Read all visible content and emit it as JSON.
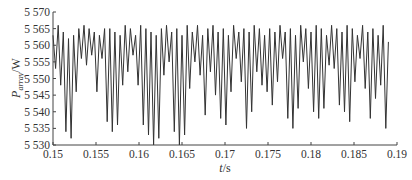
{
  "chart_data": {
    "type": "line",
    "title": "",
    "xlabel": "t/s",
    "xlabel_var": "t",
    "xlabel_unit": "/s",
    "ylabel": "P_array/W",
    "ylabel_var": "P",
    "ylabel_sub": "array",
    "ylabel_unit": "/W",
    "xlim": [
      0.15,
      0.19
    ],
    "ylim": [
      5530,
      5570
    ],
    "xticks": [
      0.15,
      0.155,
      0.16,
      0.165,
      0.17,
      0.175,
      0.18,
      0.185,
      0.19
    ],
    "xtick_labels": [
      "0.15",
      "0.155",
      "0.16",
      "0.165",
      "0.17",
      "0.175",
      "0.18",
      "0.185",
      "0.19"
    ],
    "yticks": [
      5530,
      5535,
      5540,
      5545,
      5550,
      5555,
      5560,
      5565,
      5570
    ],
    "ytick_labels": [
      "5 530",
      "5 535",
      "5 540",
      "5 545",
      "5 550",
      "5 555",
      "5 560",
      "5 565",
      "5 570"
    ],
    "grid": false,
    "legend": null,
    "line_color": "#333333",
    "series": [
      {
        "name": "P_array",
        "description": "High-frequency oscillating array power (~1.7 kHz); peaks ~5560-5567 W, troughs vary between ~5530 and ~5555 W with a beating envelope",
        "x": [
          0.15,
          0.1503,
          0.1506,
          0.1509,
          0.1512,
          0.1515,
          0.1518,
          0.1521,
          0.1524,
          0.1527,
          0.153,
          0.1533,
          0.1536,
          0.1539,
          0.1542,
          0.1545,
          0.1548,
          0.1551,
          0.1554,
          0.1557,
          0.156,
          0.1563,
          0.1566,
          0.1569,
          0.1572,
          0.1575,
          0.1578,
          0.1581,
          0.1584,
          0.1587,
          0.159,
          0.1593,
          0.1596,
          0.1599,
          0.1602,
          0.1605,
          0.1608,
          0.1611,
          0.1614,
          0.1617,
          0.162,
          0.1623,
          0.1626,
          0.1629,
          0.1632,
          0.1635,
          0.1638,
          0.1641,
          0.1644,
          0.1647,
          0.165,
          0.1653,
          0.1656,
          0.1659,
          0.1662,
          0.1665,
          0.1668,
          0.1671,
          0.1674,
          0.1677,
          0.168,
          0.1683,
          0.1686,
          0.1689,
          0.1692,
          0.1695,
          0.1698,
          0.1701,
          0.1704,
          0.1707,
          0.171,
          0.1713,
          0.1716,
          0.1719,
          0.1722,
          0.1725,
          0.1728,
          0.1731,
          0.1734,
          0.1737,
          0.174,
          0.1743,
          0.1746,
          0.1749,
          0.1752,
          0.1755,
          0.1758,
          0.1761,
          0.1764,
          0.1767,
          0.177,
          0.1773,
          0.1776,
          0.1779,
          0.1782,
          0.1785,
          0.1788,
          0.1791,
          0.1794,
          0.1797,
          0.18,
          0.1803,
          0.1806,
          0.1809,
          0.1812,
          0.1815,
          0.1818,
          0.1821,
          0.1824,
          0.1827,
          0.183,
          0.1833,
          0.1836,
          0.1839,
          0.1842,
          0.1845,
          0.1848,
          0.1851,
          0.1854,
          0.1857,
          0.186,
          0.1863,
          0.1866,
          0.1869,
          0.1872,
          0.1875,
          0.1878,
          0.1881,
          0.1884,
          0.1887,
          0.189
        ],
        "values": [
          5563,
          5553,
          5566,
          5548,
          5564,
          5534,
          5562,
          5532,
          5563,
          5546,
          5565,
          5556,
          5566,
          5554,
          5565,
          5557,
          5564,
          5546,
          5563,
          5556,
          5565,
          5537,
          5565,
          5534,
          5564,
          5536,
          5563,
          5548,
          5566,
          5552,
          5565,
          5557,
          5563,
          5548,
          5566,
          5536,
          5565,
          5533,
          5564,
          5530,
          5563,
          5532,
          5565,
          5551,
          5566,
          5555,
          5564,
          5534,
          5565,
          5530,
          5563,
          5533,
          5566,
          5547,
          5564,
          5555,
          5566,
          5551,
          5563,
          5539,
          5565,
          5552,
          5566,
          5545,
          5564,
          5538,
          5565,
          5536,
          5563,
          5546,
          5566,
          5556,
          5564,
          5549,
          5565,
          5535,
          5564,
          5540,
          5566,
          5552,
          5565,
          5548,
          5563,
          5546,
          5565,
          5542,
          5564,
          5549,
          5566,
          5556,
          5564,
          5538,
          5565,
          5535,
          5563,
          5541,
          5566,
          5555,
          5565,
          5547,
          5564,
          5540,
          5566,
          5538,
          5565,
          5541,
          5563,
          5554,
          5566,
          5553,
          5565,
          5542,
          5564,
          5540,
          5566,
          5537,
          5565,
          5549,
          5563,
          5556,
          5566,
          5547,
          5564,
          5538,
          5565,
          5544,
          5563,
          5548,
          5566,
          5535,
          5561
        ]
      }
    ]
  }
}
